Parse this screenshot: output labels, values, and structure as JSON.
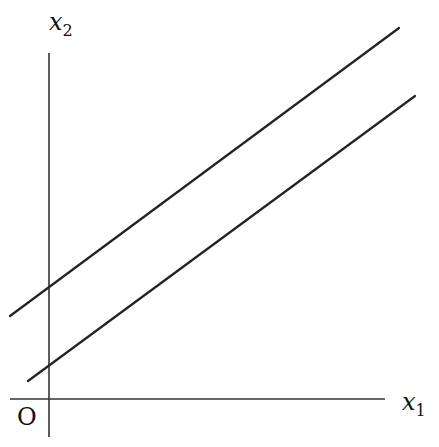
{
  "diagram": {
    "type": "coordinate-plane-parallel-lines",
    "axes": {
      "x_label_var": "x",
      "x_label_sub": "1",
      "y_label_var": "x",
      "y_label_sub": "2",
      "origin_label": "O"
    },
    "lines": [
      {
        "name": "upper-line",
        "description": "line with positive slope, larger x2-intercept"
      },
      {
        "name": "lower-line",
        "description": "parallel line with positive slope, smaller x2-intercept"
      }
    ],
    "colors": {
      "stroke": "#222222",
      "background": "#ffffff"
    }
  }
}
